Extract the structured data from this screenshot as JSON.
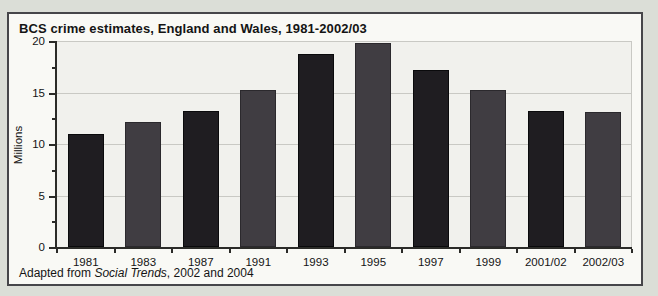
{
  "figure": {
    "title": "BCS crime estimates, England and Wales, 1981-2002/03",
    "footer": {
      "prefix": "Adapted from ",
      "source": "Social Trends",
      "suffix": ", 2002 and 2004"
    }
  },
  "chart_data": {
    "type": "bar",
    "title": "BCS crime estimates, England and Wales, 1981-2002/03",
    "xlabel": "",
    "ylabel": "Millions",
    "categories": [
      "1981",
      "1983",
      "1987",
      "1991",
      "1993",
      "1995",
      "1997",
      "1999",
      "2001/02",
      "2002/03"
    ],
    "values": [
      11.0,
      12.1,
      13.2,
      15.2,
      18.7,
      19.8,
      17.2,
      15.2,
      13.2,
      13.1
    ],
    "ylim": [
      0,
      20
    ],
    "yticks": [
      0,
      5,
      10,
      15,
      20
    ],
    "minor_ytick_step": 2.5,
    "grid": true,
    "legend": false,
    "bar_colors": [
      "#1f1d21",
      "#403d42"
    ],
    "bar_border_colors": [
      "#0a0a0c",
      "#2b292d"
    ]
  },
  "colors": {
    "page_bg": "#dbded7",
    "figure_bg": "#f9f9f5",
    "figure_border": "#46464a",
    "plot_bg": "#f1f1ed",
    "gridline": "#c9c9c4",
    "axis": "#2b2b28",
    "text": "#141414"
  }
}
